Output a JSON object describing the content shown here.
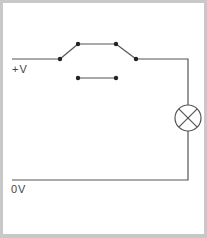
{
  "diagram": {
    "type": "circuit-schematic",
    "labels": {
      "positive_rail": "+V",
      "ground_rail": "0V"
    },
    "components": [
      {
        "name": "two-way switch (changeover / DPDT style contacts)",
        "state": "upper path closed"
      },
      {
        "name": "lamp",
        "symbol": "circle with cross"
      }
    ],
    "colors": {
      "wire": "#555555",
      "border": "#c8c8c8",
      "background": "#ffffff",
      "text": "#444444"
    }
  }
}
